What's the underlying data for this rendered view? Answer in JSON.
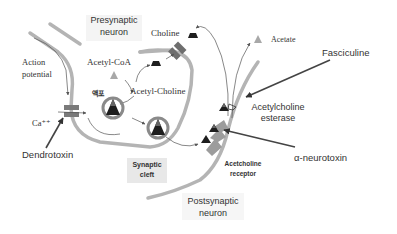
{
  "diagram": {
    "type": "synaptic-transmission",
    "labels": {
      "presynaptic": [
        "Presynaptic",
        "neuron"
      ],
      "postsynaptic": [
        "Postsynaptic",
        "neuron"
      ],
      "action_potential": [
        "Action",
        "potential"
      ],
      "acetyl_coa": "Acetyl-CoA",
      "choline": "Choline",
      "acetate": "Acetate",
      "acetyl_choline": "Acetyl-Choline",
      "vesicle_korean": "액포",
      "calcium": "Ca⁺⁺",
      "synaptic_cleft": [
        "Synaptic",
        "cleft"
      ],
      "ach_esterase": [
        "Acetylcholine",
        "esterase"
      ],
      "ach_receptor": [
        "Acetcholine",
        "receptor"
      ]
    },
    "toxins": {
      "dendrotoxin": "Dendrotoxin",
      "fasciculine": "Fasciculine",
      "alpha_neurotoxin": "α-neurotoxin"
    },
    "colors": {
      "membrane": "#b4b4b4",
      "molecule": "#1e1e1e",
      "acetate": "#a8a8a8",
      "toxin_arrow": "#444444",
      "label_bg": "#eeeeee"
    }
  }
}
